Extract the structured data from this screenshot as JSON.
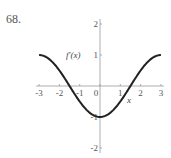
{
  "problem": {
    "number": "68."
  },
  "chart_data": {
    "type": "line",
    "title": "",
    "xlabel": "x",
    "ylabel": "f′(x)",
    "xlim": [
      -3,
      3
    ],
    "ylim": [
      -2,
      2
    ],
    "x_ticks": [
      -3,
      -2,
      -1,
      0,
      1,
      2,
      3
    ],
    "x_tick_labels": [
      "-3",
      "-2",
      "-1",
      "0",
      "1",
      "2",
      "3"
    ],
    "y_ticks": [
      -2,
      -1,
      1,
      2
    ],
    "y_tick_labels": [
      "-2",
      "-1",
      "1",
      "2"
    ],
    "grid": false,
    "legend": null,
    "series": [
      {
        "name": "f′(x)",
        "function_form": "-cos(πx/3)",
        "x": [
          -3,
          -2.5,
          -2,
          -1.5,
          -1,
          -0.5,
          0,
          0.5,
          1,
          1.5,
          2,
          2.5,
          3
        ],
        "y": [
          1,
          0.87,
          0.5,
          0,
          -0.5,
          -0.87,
          -1,
          -0.87,
          -0.5,
          0,
          0.5,
          0.87,
          1
        ],
        "color": "#222222"
      }
    ]
  }
}
